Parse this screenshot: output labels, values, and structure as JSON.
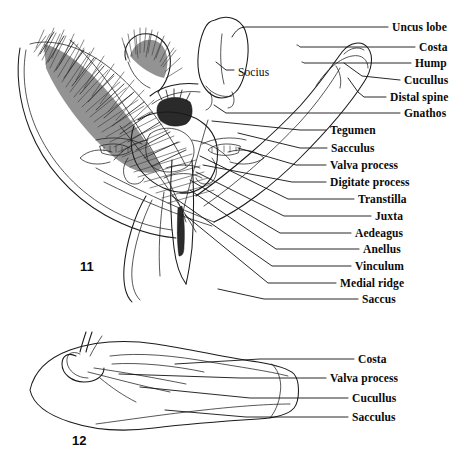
{
  "plate": {
    "title": "Male genitalia figures",
    "background_color": "#ffffff",
    "ink_color": "#111111",
    "figures": [
      {
        "number": "11",
        "caption_x": 80,
        "caption_y": 266,
        "view": "ventral view of male genitalia"
      },
      {
        "number": "12",
        "caption_x": 72,
        "caption_y": 440,
        "view": "lateral view of valva"
      }
    ]
  },
  "figure11": {
    "number": "11",
    "inline_labels": [
      {
        "name": "socius",
        "text": "Socius",
        "x": 238,
        "y": 72
      }
    ],
    "labels": [
      {
        "name": "uncus-lobe",
        "text": "Uncus lobe",
        "x": 392,
        "y": 27,
        "leader_x": 388,
        "anchor_x": 232,
        "anchor_y": 37
      },
      {
        "name": "costa",
        "text": "Costa",
        "x": 419,
        "y": 47,
        "leader_x": 415,
        "anchor_x": 297,
        "anchor_y": 45
      },
      {
        "name": "hump",
        "text": "Hump",
        "x": 415,
        "y": 63,
        "leader_x": 411,
        "anchor_x": 302,
        "anchor_y": 62
      },
      {
        "name": "cucullus",
        "text": "Cucullus",
        "x": 404,
        "y": 80,
        "leader_x": 400,
        "anchor_x": 344,
        "anchor_y": 63
      },
      {
        "name": "distal-spine",
        "text": "Distal spine",
        "x": 390,
        "y": 97,
        "leader_x": 386,
        "anchor_x": 348,
        "anchor_y": 78
      },
      {
        "name": "gnathos",
        "text": "Gnathos",
        "x": 404,
        "y": 113,
        "leader_x": 400,
        "anchor_x": 214,
        "anchor_y": 105
      },
      {
        "name": "tegumen",
        "text": "Tegumen",
        "x": 330,
        "y": 130,
        "leader_x": 326,
        "anchor_x": 210,
        "anchor_y": 120
      },
      {
        "name": "sacculus",
        "text": "Sacculus",
        "x": 331,
        "y": 148,
        "leader_x": 327,
        "anchor_x": 237,
        "anchor_y": 133
      },
      {
        "name": "valva-process",
        "text": "Valva process",
        "x": 330,
        "y": 165,
        "leader_x": 326,
        "anchor_x": 238,
        "anchor_y": 148
      },
      {
        "name": "digitate-process",
        "text": "Digitate process",
        "x": 330,
        "y": 182,
        "leader_x": 326,
        "anchor_x": 203,
        "anchor_y": 165
      },
      {
        "name": "transtilla",
        "text": "Transtilla",
        "x": 358,
        "y": 199,
        "leader_x": 354,
        "anchor_x": 200,
        "anchor_y": 155
      },
      {
        "name": "juxta",
        "text": "Juxta",
        "x": 375,
        "y": 216,
        "leader_x": 371,
        "anchor_x": 196,
        "anchor_y": 172
      },
      {
        "name": "aedeagus",
        "text": "Aedeagus",
        "x": 355,
        "y": 233,
        "leader_x": 351,
        "anchor_x": 190,
        "anchor_y": 180
      },
      {
        "name": "anellus",
        "text": "Anellus",
        "x": 363,
        "y": 249,
        "leader_x": 359,
        "anchor_x": 190,
        "anchor_y": 190
      },
      {
        "name": "vinculum",
        "text": "Vinculum",
        "x": 355,
        "y": 266,
        "leader_x": 351,
        "anchor_x": 172,
        "anchor_y": 196
      },
      {
        "name": "medial-ridge",
        "text": "Medial ridge",
        "x": 340,
        "y": 283,
        "leader_x": 336,
        "anchor_x": 185,
        "anchor_y": 215
      },
      {
        "name": "saccus",
        "text": "Saccus",
        "x": 362,
        "y": 299,
        "leader_x": 358,
        "anchor_x": 218,
        "anchor_y": 289
      }
    ]
  },
  "figure12": {
    "number": "12",
    "labels": [
      {
        "name": "costa",
        "text": "Costa",
        "x": 358,
        "y": 359,
        "leader_x": 354,
        "anchor_x": 175,
        "anchor_y": 364
      },
      {
        "name": "valva-process",
        "text": "Valva process",
        "x": 330,
        "y": 378,
        "leader_x": 326,
        "anchor_x": 119,
        "anchor_y": 374
      },
      {
        "name": "cucullus",
        "text": "Cucullus",
        "x": 352,
        "y": 398,
        "leader_x": 348,
        "anchor_x": 140,
        "anchor_y": 387
      },
      {
        "name": "sacculus",
        "text": "Sacculus",
        "x": 352,
        "y": 417,
        "leader_x": 348,
        "anchor_x": 165,
        "anchor_y": 410
      }
    ]
  }
}
